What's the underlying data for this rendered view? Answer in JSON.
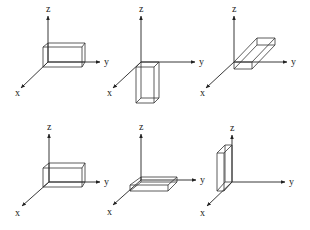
{
  "figure": {
    "axis_labels": {
      "x": "x",
      "y": "y",
      "z": "z"
    },
    "panels": [
      {
        "id": 1,
        "orientation": "box elongated along y, upright",
        "origin": [
          48,
          62
        ],
        "z_tip": [
          48,
          16
        ],
        "y_tip": [
          100,
          62
        ],
        "x_tip": [
          21,
          88
        ],
        "z_label": [
          46,
          12
        ],
        "y_label": [
          104,
          65
        ],
        "x_label": [
          15,
          96
        ],
        "box": {
          "back": [
            [
              48,
              43
            ],
            [
              85,
              43
            ],
            [
              85,
              62
            ],
            [
              48,
              62
            ]
          ],
          "front": [
            [
              43,
              47
            ],
            [
              82,
              47
            ],
            [
              82,
              67
            ],
            [
              43,
              67
            ]
          ]
        }
      },
      {
        "id": 2,
        "orientation": "box elongated downward along -z",
        "origin": [
          141,
          62
        ],
        "z_tip": [
          141,
          16
        ],
        "y_tip": [
          195,
          62
        ],
        "x_tip": [
          113,
          88
        ],
        "z_label": [
          139,
          12
        ],
        "y_label": [
          199,
          65
        ],
        "x_label": [
          107,
          96
        ],
        "box": {
          "back": [
            [
              141,
              62
            ],
            [
              159,
              62
            ],
            [
              159,
              98
            ],
            [
              141,
              98
            ]
          ],
          "front": [
            [
              136,
              67
            ],
            [
              154,
              67
            ],
            [
              154,
              103
            ],
            [
              136,
              103
            ]
          ]
        }
      },
      {
        "id": 3,
        "orientation": "flat box elongated along -x",
        "origin": [
          234,
          62
        ],
        "z_tip": [
          234,
          16
        ],
        "y_tip": [
          287,
          62
        ],
        "x_tip": [
          206,
          88
        ],
        "z_label": [
          232,
          12
        ],
        "y_label": [
          291,
          65
        ],
        "x_label": [
          200,
          96
        ],
        "box": {
          "near": [
            [
              234,
              62
            ],
            [
              252,
              62
            ],
            [
              252,
              69
            ],
            [
              234,
              69
            ]
          ],
          "far": [
            [
              257,
              38
            ],
            [
              275,
              38
            ],
            [
              275,
              45
            ],
            [
              257,
              45
            ]
          ]
        }
      },
      {
        "id": 4,
        "orientation": "box elongated along y, upright (repeat of panel 1)",
        "origin": [
          49,
          182
        ],
        "z_tip": [
          49,
          134
        ],
        "y_tip": [
          100,
          182
        ],
        "x_tip": [
          22,
          206
        ],
        "z_label": [
          47,
          130
        ],
        "y_label": [
          104,
          185
        ],
        "x_label": [
          15,
          216
        ],
        "box": {
          "back": [
            [
              49,
              163
            ],
            [
              85,
              163
            ],
            [
              85,
              182
            ],
            [
              49,
              182
            ]
          ],
          "front": [
            [
              43,
              168
            ],
            [
              82,
              168
            ],
            [
              82,
              187
            ],
            [
              43,
              187
            ]
          ]
        }
      },
      {
        "id": 5,
        "orientation": "flat slab elongated along y",
        "origin": [
          141,
          180
        ],
        "z_tip": [
          141,
          134
        ],
        "y_tip": [
          196,
          180
        ],
        "x_tip": [
          113,
          205
        ],
        "z_label": [
          139,
          130
        ],
        "y_label": [
          200,
          183
        ],
        "x_label": [
          107,
          215
        ],
        "box": {
          "back": [
            [
              141,
              177
            ],
            [
              177,
              177
            ],
            [
              177,
              182
            ],
            [
              141,
              182
            ]
          ],
          "front": [
            [
              130,
              185
            ],
            [
              168,
              185
            ],
            [
              168,
              191
            ],
            [
              130,
              191
            ]
          ]
        }
      },
      {
        "id": 6,
        "orientation": "thin tall plate along z, thin in y",
        "origin": [
          232,
          182
        ],
        "z_tip": [
          232,
          135
        ],
        "y_tip": [
          285,
          182
        ],
        "x_tip": [
          207,
          206
        ],
        "z_label": [
          230,
          131
        ],
        "y_label": [
          289,
          185
        ],
        "x_label": [
          200,
          216
        ],
        "box": {
          "back": [
            [
              225,
              145
            ],
            [
              232,
              145
            ],
            [
              232,
              182
            ],
            [
              225,
              182
            ]
          ],
          "front": [
            [
              217,
              153
            ],
            [
              224,
              153
            ],
            [
              224,
              191
            ],
            [
              217,
              191
            ]
          ]
        }
      }
    ]
  }
}
